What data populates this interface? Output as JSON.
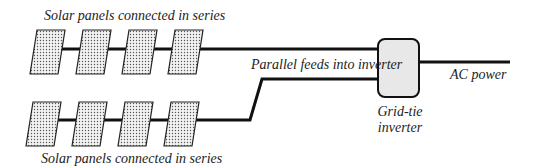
{
  "colors": {
    "background": "#ffffff",
    "wire": "#111111",
    "panel_fill": "#d9d9d9",
    "panel_stroke": "#222222",
    "inverter_fill": "#e8e8e8",
    "text": "#222222"
  },
  "labels": {
    "top_string": "Solar panels connected in series",
    "bottom_string": "Solar panels connected in series",
    "parallel_feeds": "Parallel feeds into inverter",
    "ac_power": "AC power",
    "inverter_line1": "Grid-tie",
    "inverter_line2": "inverter"
  },
  "strings": [
    {
      "name": "top",
      "panel_count": 4
    },
    {
      "name": "bottom",
      "panel_count": 4
    }
  ]
}
